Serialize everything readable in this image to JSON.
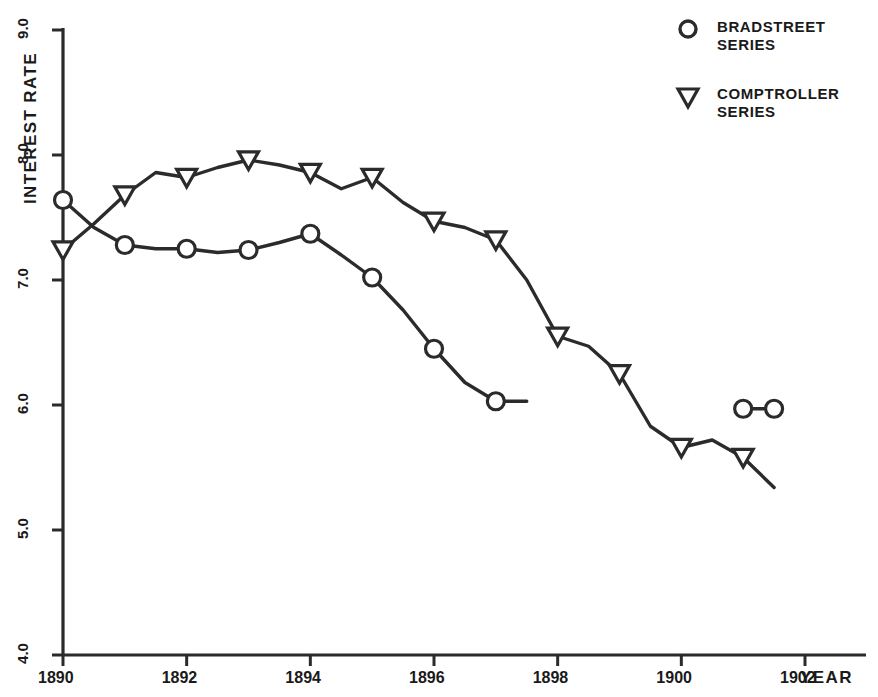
{
  "chart_data": {
    "type": "line",
    "title": "",
    "xlabel": "YEAR",
    "ylabel": "INTEREST RATE",
    "xlim": [
      1890,
      1902.9
    ],
    "ylim": [
      4.0,
      9.0
    ],
    "grid": false,
    "legend_position": "top-right",
    "x_ticks": [
      "1890",
      "1892",
      "1894",
      "1896",
      "1898",
      "1900",
      "1902"
    ],
    "x_tick_values": [
      1890,
      1892,
      1894,
      1896,
      1898,
      1900,
      1902
    ],
    "y_ticks": [
      "4.0",
      "5.0",
      "6.0",
      "7.0",
      "8.0",
      "9.0"
    ],
    "y_tick_values": [
      4.0,
      5.0,
      6.0,
      7.0,
      8.0,
      9.0
    ],
    "series": [
      {
        "name": "BRADSTREET SERIES",
        "marker": "circle",
        "color": "#2b2b2b",
        "x": [
          1890,
          1890.5,
          1891,
          1891.5,
          1892,
          1892.5,
          1893,
          1893.5,
          1894,
          1894.5,
          1895,
          1895.5,
          1896,
          1896.5,
          1897,
          1897.5
        ],
        "y": [
          7.64,
          7.42,
          7.28,
          7.25,
          7.25,
          7.22,
          7.24,
          7.3,
          7.37,
          7.2,
          7.02,
          6.76,
          6.45,
          6.18,
          6.03,
          6.03
        ],
        "marker_x": [
          1890,
          1891,
          1892,
          1893,
          1894,
          1895,
          1896,
          1897
        ],
        "marker_y": [
          7.64,
          7.28,
          7.25,
          7.24,
          7.37,
          7.02,
          6.45,
          6.03
        ]
      },
      {
        "name": "BRADSTREET SERIES",
        "marker": "circle",
        "color": "#2b2b2b",
        "segment": "late",
        "x": [
          1901,
          1901.5
        ],
        "y": [
          5.97,
          5.97
        ],
        "marker_x": [
          1901,
          1901.5
        ],
        "marker_y": [
          5.97,
          5.97
        ]
      },
      {
        "name": "COMPTROLLER SERIES",
        "marker": "triangle-down",
        "color": "#2b2b2b",
        "x": [
          1890,
          1890.5,
          1891,
          1891.5,
          1892,
          1892.5,
          1893,
          1893.5,
          1894,
          1894.5,
          1895,
          1895.5,
          1896,
          1896.5,
          1897,
          1897.5,
          1898,
          1898.5,
          1899,
          1899.5,
          1900,
          1900.5,
          1901,
          1901.5
        ],
        "y": [
          7.24,
          7.45,
          7.68,
          7.86,
          7.82,
          7.9,
          7.96,
          7.92,
          7.86,
          7.73,
          7.82,
          7.62,
          7.47,
          7.42,
          7.32,
          7.0,
          6.55,
          6.47,
          6.25,
          5.83,
          5.66,
          5.72,
          5.58,
          5.34
        ],
        "marker_x": [
          1890,
          1891,
          1892,
          1893,
          1894,
          1895,
          1896,
          1897,
          1898,
          1899,
          1900,
          1901
        ],
        "marker_y": [
          7.24,
          7.68,
          7.82,
          7.96,
          7.86,
          7.82,
          7.47,
          7.32,
          6.55,
          6.25,
          5.66,
          5.58
        ]
      }
    ]
  },
  "legend": {
    "entries": [
      {
        "marker": "circle",
        "line1": "BRADSTREET",
        "line2": "SERIES"
      },
      {
        "marker": "triangle-down",
        "line1": "COMPTROLLER",
        "line2": "SERIES"
      }
    ]
  },
  "colors": {
    "ink": "#2b2b2b",
    "background": "#ffffff"
  }
}
